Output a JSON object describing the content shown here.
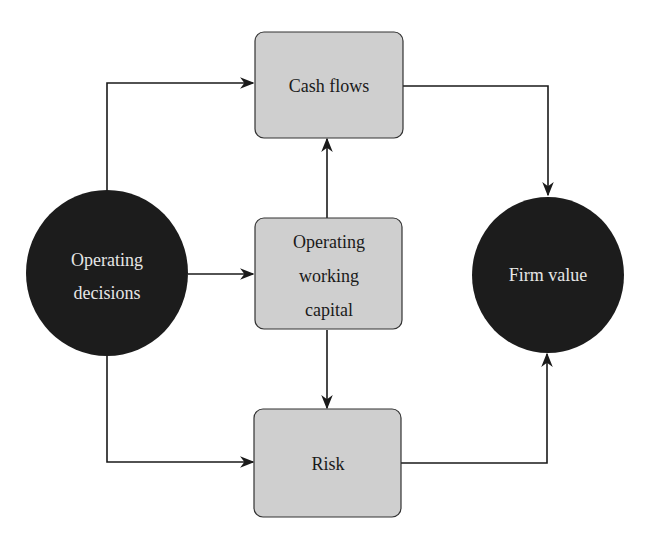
{
  "diagram": {
    "type": "flow",
    "colors": {
      "box_fill": "#cfcfcf",
      "box_stroke": "#333333",
      "circle_fill": "#1c1c1c",
      "circle_text": "#e6e6e6",
      "box_text": "#1a1a1a",
      "line": "#1a1a1a"
    },
    "nodes": {
      "operating_decisions": {
        "shape": "circle",
        "lines": [
          "Operating",
          "decisions"
        ]
      },
      "cash_flows": {
        "shape": "rounded-box",
        "lines": [
          "Cash flows"
        ]
      },
      "operating_working_capital": {
        "shape": "rounded-box",
        "lines": [
          "Operating",
          "working",
          "capital"
        ]
      },
      "risk": {
        "shape": "rounded-box",
        "lines": [
          "Risk"
        ]
      },
      "firm_value": {
        "shape": "circle",
        "lines": [
          "Firm value"
        ]
      }
    },
    "edges": [
      {
        "from": "operating_decisions",
        "to": "cash_flows"
      },
      {
        "from": "operating_decisions",
        "to": "operating_working_capital"
      },
      {
        "from": "operating_decisions",
        "to": "risk"
      },
      {
        "from": "operating_working_capital",
        "to": "cash_flows"
      },
      {
        "from": "operating_working_capital",
        "to": "risk"
      },
      {
        "from": "cash_flows",
        "to": "firm_value"
      },
      {
        "from": "risk",
        "to": "firm_value"
      }
    ]
  }
}
